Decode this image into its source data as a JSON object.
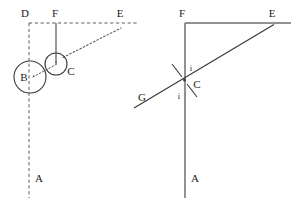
{
  "figure": {
    "panels": [
      {
        "id": "left-panel",
        "name": "construction-panel",
        "description": "Dashed construction with two tangent circles",
        "labels": [
          {
            "key": "D",
            "text": "D",
            "x": 25,
            "y": 17
          },
          {
            "key": "F",
            "text": "F",
            "x": 52,
            "y": 17
          },
          {
            "key": "E",
            "text": "E",
            "x": 118,
            "y": 17
          },
          {
            "key": "B",
            "text": "B",
            "x": 22,
            "y": 81
          },
          {
            "key": "C",
            "text": "C",
            "x": 66,
            "y": 74
          },
          {
            "key": "A",
            "text": "A",
            "x": 36,
            "y": 180
          }
        ],
        "circles": [
          {
            "key": "circle-B",
            "cx": 30,
            "cy": 77,
            "r": 16
          },
          {
            "key": "circle-C",
            "cx": 56,
            "cy": 64,
            "r": 11
          }
        ],
        "segments": [
          {
            "key": "dashed-horizontal-DE",
            "x1": 29,
            "y1": 23,
            "x2": 138,
            "y2": 23,
            "style": "dashed"
          },
          {
            "key": "dashed-vertical-DA",
            "x1": 29,
            "y1": 23,
            "x2": 29,
            "y2": 198,
            "style": "dashed"
          },
          {
            "key": "solid-vertical-F",
            "x1": 56,
            "y1": 23,
            "x2": 56,
            "y2": 64,
            "style": "solid"
          },
          {
            "key": "dotted-ray-CE",
            "x1": 62,
            "y1": 58,
            "x2": 121,
            "y2": 28,
            "style": "dotted"
          },
          {
            "key": "dotted-chord-B",
            "x1": 31,
            "y1": 78,
            "x2": 56,
            "y2": 64,
            "style": "dotted"
          }
        ]
      },
      {
        "id": "right-panel",
        "name": "incidence-panel",
        "description": "Normal, incident ray GC and reflected ray CE with equal angles i",
        "labels": [
          {
            "key": "F",
            "text": "F",
            "x": 180,
            "y": 17
          },
          {
            "key": "E",
            "text": "E",
            "x": 268,
            "y": 17
          },
          {
            "key": "C",
            "text": "C",
            "x": 194,
            "y": 87
          },
          {
            "key": "G",
            "text": "G",
            "x": 139,
            "y": 100
          },
          {
            "key": "i-upper",
            "text": "i",
            "x": 189,
            "y": 71
          },
          {
            "key": "i-lower",
            "text": "i",
            "x": 178,
            "y": 98
          },
          {
            "key": "A",
            "text": "A",
            "x": 192,
            "y": 180
          }
        ],
        "segments": [
          {
            "key": "solid-horizontal-FE",
            "x1": 185,
            "y1": 23,
            "x2": 290,
            "y2": 23,
            "style": "solid"
          },
          {
            "key": "solid-vertical-FA",
            "x1": 185,
            "y1": 23,
            "x2": 185,
            "y2": 198,
            "style": "solid"
          },
          {
            "key": "ray-GE",
            "x1": 134,
            "y1": 108,
            "x2": 273,
            "y2": 25,
            "style": "solid"
          },
          {
            "key": "cross-mark-upper",
            "x1": 173,
            "y1": 65,
            "x2": 197,
            "y2": 97,
            "style": "solid"
          }
        ],
        "intersection": {
          "key": "point-C",
          "x": 184,
          "y": 80
        }
      }
    ],
    "colors": {
      "background": "#ffffff",
      "ink": "#3a3a3a",
      "construction": "#5c5c5c",
      "label": "#1c1c1c"
    }
  }
}
